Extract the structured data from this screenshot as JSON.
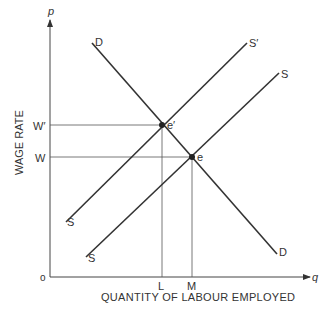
{
  "diagram": {
    "axes": {
      "y_axis_symbol": "p",
      "x_axis_symbol": "q",
      "origin_label": "o",
      "y_axis_title": "WAGE RATE",
      "x_axis_title": "QUANTITY OF LABOUR EMPLOYED"
    },
    "curves": [
      {
        "name": "demand",
        "label_start": "D",
        "label_end": "D"
      },
      {
        "name": "supply-shifted",
        "label_start": "S",
        "label_end": "S′"
      },
      {
        "name": "supply-original",
        "label_start": "S",
        "label_end": "S"
      }
    ],
    "equilibria": [
      {
        "name": "e-prime",
        "label": "e′",
        "wage_label": "W′",
        "quantity_label": "L"
      },
      {
        "name": "e",
        "label": "e",
        "wage_label": "W",
        "quantity_label": "M"
      }
    ],
    "colors": {
      "line": "#333333",
      "guide": "#555555"
    }
  }
}
